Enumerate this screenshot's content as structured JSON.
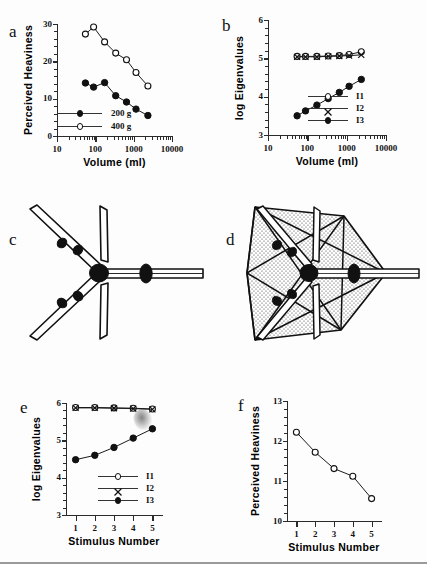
{
  "figure": {
    "background_color": "#fdfdfd",
    "ink_color": "#111111",
    "panel_letters": {
      "a": "a",
      "b": "b",
      "c": "c",
      "d": "d",
      "e": "e",
      "f": "f"
    }
  },
  "panel_a": {
    "letter": "a",
    "chart_data": {
      "type": "line",
      "title": "",
      "xlabel": "Volume  (ml)",
      "ylabel": "Perceived  Heaviness",
      "xscale": "log",
      "xlim": [
        10,
        10000
      ],
      "ylim": [
        0,
        30
      ],
      "xticks": [
        10,
        100,
        1000,
        10000
      ],
      "xticklabels": [
        "10",
        "100",
        "1000",
        "10000"
      ],
      "yticks": [
        0,
        10,
        20,
        30
      ],
      "yticklabels": [
        "0",
        "10",
        "20",
        "30"
      ],
      "grid": false,
      "legend_position": "lower-left",
      "series": [
        {
          "name": "200 g",
          "marker": "filled-circle",
          "x": [
            55,
            90,
            175,
            340,
            650,
            1150,
            2350
          ],
          "values": [
            14.2,
            13.1,
            14.3,
            10.8,
            9.1,
            7.2,
            5.5
          ]
        },
        {
          "name": "400 g",
          "marker": "open-circle",
          "x": [
            55,
            90,
            175,
            340,
            650,
            1150,
            2350
          ],
          "values": [
            27.3,
            29.2,
            25.2,
            22.2,
            20.4,
            17.0,
            13.4
          ]
        }
      ]
    }
  },
  "panel_b": {
    "letter": "b",
    "chart_data": {
      "type": "line",
      "title": "",
      "xlabel": "Volume  (ml)",
      "ylabel": "log  Eigenvalues",
      "xscale": "log",
      "xlim": [
        10,
        10000
      ],
      "ylim": [
        3,
        6
      ],
      "xticks": [
        10,
        100,
        1000,
        10000
      ],
      "xticklabels": [
        "10",
        "100",
        "1000",
        "10000"
      ],
      "yticks": [
        3,
        4,
        5,
        6
      ],
      "yticklabels": [
        "3",
        "4",
        "5",
        "6"
      ],
      "grid": false,
      "legend_position": "lower-right",
      "series": [
        {
          "name": "I1",
          "marker": "open-circle",
          "x": [
            55,
            90,
            175,
            340,
            650,
            1150,
            2350
          ],
          "values": [
            5.05,
            5.05,
            5.05,
            5.06,
            5.07,
            5.1,
            5.17
          ]
        },
        {
          "name": "I2",
          "marker": "cross",
          "x": [
            55,
            90,
            175,
            340,
            650,
            1150,
            2350
          ],
          "values": [
            5.04,
            5.04,
            5.04,
            5.05,
            5.06,
            5.07,
            5.09
          ]
        },
        {
          "name": "I3",
          "marker": "filled-circle",
          "x": [
            55,
            90,
            175,
            340,
            650,
            1150,
            2350
          ],
          "values": [
            3.5,
            3.63,
            3.78,
            3.95,
            4.11,
            4.27,
            4.45
          ]
        }
      ]
    }
  },
  "panel_c": {
    "letter": "c",
    "description": "line-drawing of a tensor object: four diagonal rods and one horizontal rod radiating from a central hub, with small ring weights on the rods",
    "artifact": "gray smudge"
  },
  "panel_d": {
    "letter": "d",
    "description": "same tensor object enclosed in a stippled polyhedral envelope"
  },
  "panel_e": {
    "letter": "e",
    "chart_data": {
      "type": "line",
      "title": "",
      "xlabel": "Stimulus  Number",
      "ylabel": "log  Eigenvalues",
      "xscale": "linear",
      "xlim": [
        0.5,
        5.5
      ],
      "ylim": [
        3,
        6
      ],
      "xticks": [
        1,
        2,
        3,
        4,
        5
      ],
      "xticklabels": [
        "1",
        "2",
        "3",
        "4",
        "5"
      ],
      "yticks": [
        3,
        4,
        5,
        6
      ],
      "yticklabels": [
        "3",
        "4",
        "5",
        "6"
      ],
      "grid": false,
      "legend_position": "lower-right",
      "series": [
        {
          "name": "I1",
          "marker": "open-circle",
          "x": [
            1,
            2,
            3,
            4,
            5
          ],
          "values": [
            5.88,
            5.88,
            5.87,
            5.86,
            5.84
          ]
        },
        {
          "name": "I2",
          "marker": "cross",
          "x": [
            1,
            2,
            3,
            4,
            5
          ],
          "values": [
            5.87,
            5.87,
            5.86,
            5.85,
            5.83
          ]
        },
        {
          "name": "I3",
          "marker": "filled-circle",
          "x": [
            1,
            2,
            3,
            4,
            5
          ],
          "values": [
            4.48,
            4.6,
            4.81,
            5.06,
            5.31
          ]
        }
      ]
    }
  },
  "panel_f": {
    "letter": "f",
    "chart_data": {
      "type": "line",
      "title": "",
      "xlabel": "Stimulus  Number",
      "ylabel": "Perceived  Heaviness",
      "xscale": "linear",
      "xlim": [
        0.5,
        5.5
      ],
      "ylim": [
        10,
        13
      ],
      "xticks": [
        1,
        2,
        3,
        4,
        5
      ],
      "xticklabels": [
        "1",
        "2",
        "3",
        "4",
        "5"
      ],
      "yticks": [
        10,
        11,
        12,
        13
      ],
      "yticklabels": [
        "10",
        "11",
        "12",
        "13"
      ],
      "grid": false,
      "legend_position": "none",
      "series": [
        {
          "name": "Perceived Heaviness",
          "marker": "open-circle",
          "x": [
            1,
            2,
            3,
            4,
            5
          ],
          "values": [
            12.22,
            11.72,
            11.31,
            11.12,
            10.56
          ]
        }
      ]
    }
  }
}
